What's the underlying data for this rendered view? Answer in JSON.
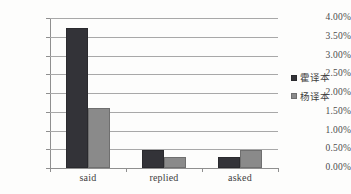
{
  "chart_data": {
    "type": "bar",
    "title": "",
    "subtitle": "",
    "xlabel": "",
    "ylabel": "",
    "categories": [
      "said",
      "replied",
      "asked"
    ],
    "series": [
      {
        "name": "霍译本",
        "color": "#333338",
        "values": [
          3.74,
          0.48,
          0.29
        ]
      },
      {
        "name": "杨译本",
        "color": "#8a8a8a",
        "values": [
          1.6,
          0.28,
          0.47
        ]
      }
    ],
    "ylim": [
      0,
      4
    ],
    "ytick_values": [
      0,
      0.5,
      1,
      1.5,
      2,
      2.5,
      3,
      3.5,
      4
    ],
    "ytick_labels": [
      "0.00%",
      "0.50%",
      "1.00%",
      "1.50%",
      "2.00%",
      "2.50%",
      "3.00%",
      "3.50%",
      "4.00%"
    ],
    "grid": true,
    "grid_axis": "y",
    "legend_position": "right",
    "value_suffix": "%"
  },
  "legend": {
    "entries": [
      {
        "label": "霍译本"
      },
      {
        "label": "杨译本"
      }
    ]
  }
}
